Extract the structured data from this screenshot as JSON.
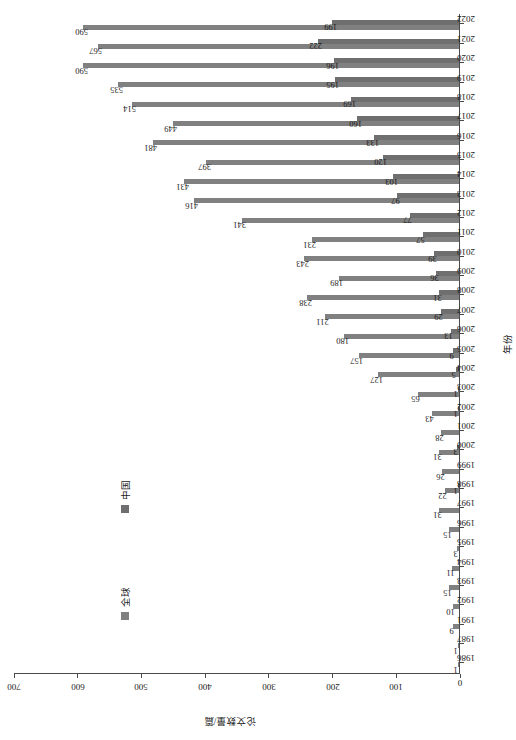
{
  "chart_data": {
    "type": "bar",
    "title": "",
    "xlabel": "年份",
    "ylabel": "论文数量/篇",
    "ylim": [
      0,
      700
    ],
    "yticks": [
      0,
      100,
      200,
      300,
      400,
      500,
      600,
      700
    ],
    "grid": false,
    "legend_position": "upper-left",
    "orientation": "vertical-bars-rotated-page",
    "categories": [
      "1986",
      "1987",
      "1991",
      "1992",
      "1993",
      "1994",
      "1995",
      "1996",
      "1997",
      "1998",
      "1999",
      "2000",
      "2001",
      "2002",
      "2003",
      "2004",
      "2005",
      "2006",
      "2007",
      "2008",
      "2009",
      "2010",
      "2011",
      "2012",
      "2013",
      "2014",
      "2015",
      "2016",
      "2017",
      "2018",
      "2019",
      "2020",
      "2021",
      "2022"
    ],
    "series": [
      {
        "name": "全球",
        "color": "#808080",
        "values": [
          1,
          1,
          9,
          10,
          15,
          11,
          3,
          15,
          31,
          22,
          26,
          31,
          28,
          43,
          65,
          127,
          157,
          180,
          211,
          238,
          189,
          243,
          231,
          341,
          416,
          431,
          397,
          481,
          449,
          514,
          535,
          590,
          567,
          590
        ],
        "labels": [
          "1",
          "1",
          "9",
          "10",
          "15",
          "11",
          "3",
          "15",
          "31",
          "22",
          "26",
          "31",
          "28",
          "43",
          "65",
          "127",
          "157",
          "180",
          "211",
          "238",
          "189",
          "243",
          "231",
          "341",
          "416",
          "431",
          "397",
          "481",
          "449",
          "514",
          "535",
          "590",
          "567",
          "590"
        ]
      },
      {
        "name": "中国",
        "color": "#6f6f6f",
        "values": [
          0,
          0,
          0,
          0,
          0,
          0,
          0,
          0,
          0,
          1,
          0,
          3,
          0,
          1,
          1,
          5,
          9,
          13,
          29,
          31,
          36,
          39,
          57,
          77,
          97,
          103,
          120,
          133,
          160,
          169,
          195,
          196,
          222,
          199
        ],
        "labels": [
          "",
          "",
          "",
          "",
          "",
          "",
          "",
          "",
          "",
          "1",
          "",
          "3",
          "",
          "1",
          "1",
          "5",
          "9",
          "13",
          "29",
          "31",
          "36",
          "39",
          "57",
          "77",
          "97",
          "103",
          "120",
          "133",
          "160",
          "169",
          "195",
          "196",
          "222",
          "199"
        ]
      }
    ]
  },
  "legend": {
    "items": [
      {
        "label": "全球",
        "color": "#808080"
      },
      {
        "label": "中国",
        "color": "#6f6f6f"
      }
    ]
  },
  "axes": {
    "value_axis_title": "论文数量/篇",
    "category_axis_title": "年份"
  }
}
